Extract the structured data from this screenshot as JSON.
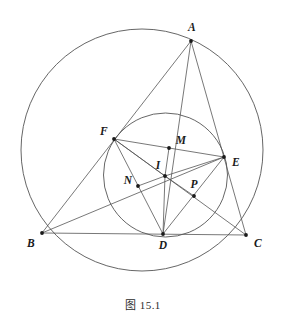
{
  "figure": {
    "caption": "图 15.1",
    "stroke_color": "#555555",
    "point_color": "#1a1a1a",
    "background": "#ffffff",
    "circumcircle": {
      "cx": 142,
      "cy": 150,
      "r": 121
    },
    "incircle": {
      "cx": 165.5,
      "cy": 175,
      "r": 62
    },
    "points": [
      {
        "id": "A",
        "label": "A",
        "x": 191,
        "y": 41,
        "lx": 192,
        "ly": 28
      },
      {
        "id": "B",
        "label": "B",
        "x": 42,
        "y": 233,
        "lx": 31,
        "ly": 244
      },
      {
        "id": "C",
        "label": "C",
        "x": 246,
        "y": 235,
        "lx": 258,
        "ly": 244
      },
      {
        "id": "D",
        "label": "D",
        "x": 163,
        "y": 234,
        "lx": 163,
        "ly": 246
      },
      {
        "id": "E",
        "label": "E",
        "x": 224,
        "y": 157,
        "lx": 236,
        "ly": 163
      },
      {
        "id": "F",
        "label": "F",
        "x": 114,
        "y": 139,
        "lx": 104,
        "ly": 132
      },
      {
        "id": "I",
        "label": "I",
        "x": 165,
        "y": 176,
        "lx": 158,
        "ly": 166
      },
      {
        "id": "M",
        "label": "M",
        "x": 169,
        "y": 148,
        "lx": 181,
        "ly": 141
      },
      {
        "id": "N",
        "label": "N",
        "x": 138,
        "y": 186,
        "lx": 128,
        "ly": 181
      },
      {
        "id": "P",
        "label": "P",
        "x": 194,
        "y": 196,
        "lx": 194,
        "ly": 185
      }
    ],
    "segments": [
      {
        "name": "side-AB",
        "from": "A",
        "to": "B"
      },
      {
        "name": "side-BC",
        "from": "B",
        "to": "C"
      },
      {
        "name": "side-CA",
        "from": "C",
        "to": "A"
      },
      {
        "name": "contact-FE",
        "from": "F",
        "to": "E"
      },
      {
        "name": "contact-FD",
        "from": "F",
        "to": "D"
      },
      {
        "name": "contact-DE",
        "from": "D",
        "to": "E"
      },
      {
        "name": "cevian-AD",
        "from": "A",
        "to": "D"
      },
      {
        "name": "cevian-BE",
        "from": "B",
        "to": "E"
      },
      {
        "name": "cevian-CF",
        "from": "C",
        "to": "F"
      },
      {
        "name": "radius-IM",
        "from": "I",
        "to": "M"
      },
      {
        "name": "radius-IN",
        "from": "I",
        "to": "N"
      },
      {
        "name": "radius-IP",
        "from": "I",
        "to": "P"
      },
      {
        "name": "radius-ID",
        "from": "I",
        "to": "D"
      },
      {
        "name": "radius-IE",
        "from": "I",
        "to": "E"
      },
      {
        "name": "radius-IF",
        "from": "I",
        "to": "F"
      }
    ]
  }
}
